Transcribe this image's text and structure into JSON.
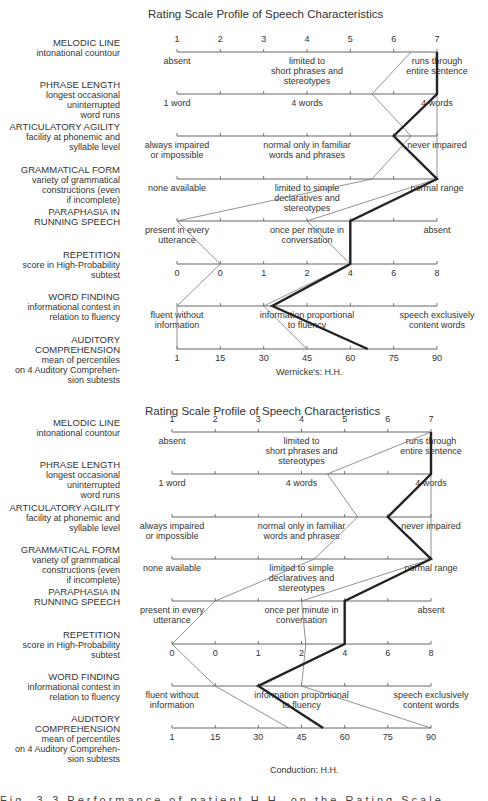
{
  "chart_data": [
    {
      "type": "line",
      "title": "Rating Scale Profile of Speech Characteristics",
      "caption": "Wernicke's: H.H.",
      "scale": "1-7 rating per row (left = impaired, right = normal)",
      "rows": [
        {
          "name": "MELODIC LINE",
          "sub": [
            "intonational countour"
          ],
          "ticks": [
            "1",
            "2",
            "3",
            "4",
            "5",
            "6",
            "7"
          ],
          "descriptors": [
            {
              "pos": 1,
              "text": [
                "absent"
              ]
            },
            {
              "pos": 4,
              "text": [
                "limited to",
                "short phrases and",
                "stereotypes"
              ]
            },
            {
              "pos": 7,
              "text": [
                "runs through",
                "entire sentence"
              ]
            }
          ]
        },
        {
          "name": "PHRASE LENGTH",
          "sub": [
            "longest occasional",
            "uninterrupted",
            "word runs"
          ],
          "ticks": [],
          "descriptors": [
            {
              "pos": 1,
              "text": [
                "1 word"
              ]
            },
            {
              "pos": 4,
              "text": [
                "4 words"
              ]
            },
            {
              "pos": 7,
              "text": [
                "4 words"
              ]
            }
          ]
        },
        {
          "name": "ARTICULATORY AGILITY",
          "sub": [
            "facility at phonemic and",
            "syllable level"
          ],
          "ticks": [],
          "descriptors": [
            {
              "pos": 1,
              "text": [
                "always impaired",
                "or impossible"
              ]
            },
            {
              "pos": 4,
              "text": [
                "normal only in familiar",
                "words and phrases"
              ]
            },
            {
              "pos": 7,
              "text": [
                "never impaired"
              ]
            }
          ]
        },
        {
          "name": "GRAMMATICAL FORM",
          "sub": [
            "variety of grammatical",
            "constructions (even",
            "if incomplete)"
          ],
          "ticks": [],
          "descriptors": [
            {
              "pos": 1,
              "text": [
                "none available"
              ]
            },
            {
              "pos": 4,
              "text": [
                "limited to simple",
                "declaratives and",
                "stereotypes"
              ]
            },
            {
              "pos": 7,
              "text": [
                "normal range"
              ]
            }
          ]
        },
        {
          "name": "PARAPHASIA IN",
          "name2": "RUNNING SPEECH",
          "sub": [],
          "ticks": [],
          "descriptors": [
            {
              "pos": 1,
              "text": [
                "present in every",
                "utterance"
              ]
            },
            {
              "pos": 4,
              "text": [
                "once per minute in",
                "conversation"
              ]
            },
            {
              "pos": 7,
              "text": [
                "absent"
              ]
            }
          ]
        },
        {
          "name": "REPETITION",
          "sub": [
            "score in High-Probability",
            "subtest"
          ],
          "ticks": [
            "0",
            "0",
            "1",
            "2",
            "4",
            "6",
            "8"
          ],
          "descriptors": []
        },
        {
          "name": "WORD FINDING",
          "sub": [
            "informational contest in",
            "relation to fluency"
          ],
          "ticks": [],
          "descriptors": [
            {
              "pos": 1,
              "text": [
                "fluent without",
                "information"
              ]
            },
            {
              "pos": 4,
              "text": [
                "information proportional",
                "to fluency"
              ]
            },
            {
              "pos": 7,
              "text": [
                "speech exclusively",
                "content words"
              ]
            }
          ]
        },
        {
          "name": "AUDITORY",
          "name2": "COMPREHENSION",
          "sub": [
            "mean of percentiles",
            "on 4 Auditory Comprehen-",
            "sion subtests"
          ],
          "ticks": [
            "1",
            "15",
            "30",
            "45",
            "60",
            "75",
            "90"
          ],
          "descriptors": []
        }
      ],
      "series": [
        {
          "name": "profile-bold",
          "style": "thick",
          "values": [
            7,
            7,
            6,
            7,
            5,
            5,
            3.2,
            5.4
          ]
        },
        {
          "name": "profile-thin-a",
          "style": "thin",
          "values": [
            6.4,
            5.5,
            6.4,
            5.5,
            1,
            2,
            1,
            1
          ]
        },
        {
          "name": "profile-thin-b",
          "style": "thin",
          "values": [
            7,
            7,
            7,
            7,
            4,
            5,
            3,
            4
          ]
        }
      ],
      "xlim": [
        1,
        7
      ]
    },
    {
      "type": "line",
      "title": "Rating Scale Profile of Speech Characteristics",
      "caption": "Conduction: H.H.",
      "scale": "1-7 rating per row (left = impaired, right = normal)",
      "rows": [
        {
          "name": "MELODIC LINE",
          "sub": [
            "intonational countour"
          ],
          "ticks": [
            "1",
            "2",
            "3",
            "4",
            "5",
            "6",
            "7"
          ],
          "descriptors": [
            {
              "pos": 1,
              "text": [
                "absent"
              ]
            },
            {
              "pos": 4,
              "text": [
                "limited to",
                "short phrases and",
                "stereotypes"
              ]
            },
            {
              "pos": 7,
              "text": [
                "runs through",
                "entire sentence"
              ]
            }
          ]
        },
        {
          "name": "PHRASE LENGTH",
          "sub": [
            "longest occasional",
            "uninterrupted",
            "word runs"
          ],
          "ticks": [],
          "descriptors": [
            {
              "pos": 1,
              "text": [
                "1 word"
              ]
            },
            {
              "pos": 4,
              "text": [
                "4 words"
              ]
            },
            {
              "pos": 7,
              "text": [
                "4 words"
              ]
            }
          ]
        },
        {
          "name": "ARTICULATORY AGILITY",
          "sub": [
            "facility at phonemic and",
            "syllable level"
          ],
          "ticks": [],
          "descriptors": [
            {
              "pos": 1,
              "text": [
                "always impaired",
                "or impossible"
              ]
            },
            {
              "pos": 4,
              "text": [
                "normal only in familiar",
                "words and phrases"
              ]
            },
            {
              "pos": 7,
              "text": [
                "never impaired"
              ]
            }
          ]
        },
        {
          "name": "GRAMMATICAL FORM",
          "sub": [
            "variety of grammatical",
            "constructions (even",
            "if incomplete)"
          ],
          "ticks": [],
          "descriptors": [
            {
              "pos": 1,
              "text": [
                "none available"
              ]
            },
            {
              "pos": 4,
              "text": [
                "limited to simple",
                "declaratives and",
                "stereotypes"
              ]
            },
            {
              "pos": 7,
              "text": [
                "normal range"
              ]
            }
          ]
        },
        {
          "name": "PARAPHASIA IN",
          "name2": "RUNNING SPEECH",
          "sub": [],
          "ticks": [],
          "descriptors": [
            {
              "pos": 1,
              "text": [
                "present in every",
                "utterance"
              ]
            },
            {
              "pos": 4,
              "text": [
                "once per minute in",
                "conversation"
              ]
            },
            {
              "pos": 7,
              "text": [
                "absent"
              ]
            }
          ]
        },
        {
          "name": "REPETITION",
          "sub": [
            "score in High-Probability",
            "subtest"
          ],
          "ticks": [
            "0",
            "0",
            "1",
            "2",
            "4",
            "6",
            "8"
          ],
          "descriptors": []
        },
        {
          "name": "WORD FINDING",
          "sub": [
            "informational contest in",
            "relation to fluency"
          ],
          "ticks": [],
          "descriptors": [
            {
              "pos": 1,
              "text": [
                "fluent without",
                "information"
              ]
            },
            {
              "pos": 4,
              "text": [
                "information proportional",
                "to fluency"
              ]
            },
            {
              "pos": 7,
              "text": [
                "speech exclusively",
                "content words"
              ]
            }
          ]
        },
        {
          "name": "AUDITORY",
          "name2": "COMPREHENSION",
          "sub": [
            "mean of percentiles",
            "on 4 Auditory Comprehen-",
            "sion subtests"
          ],
          "ticks": [
            "1",
            "15",
            "30",
            "45",
            "60",
            "75",
            "90"
          ],
          "descriptors": []
        }
      ],
      "series": [
        {
          "name": "profile-bold",
          "style": "thick",
          "values": [
            7,
            7,
            6,
            7,
            5,
            5,
            3,
            4.5
          ]
        },
        {
          "name": "profile-thin-a",
          "style": "thin",
          "values": [
            7,
            4.6,
            5.3,
            4.3,
            2,
            1,
            2,
            3.7
          ]
        },
        {
          "name": "profile-thin-b",
          "style": "thin",
          "values": [
            7,
            7,
            7,
            7,
            4,
            4.1,
            4,
            7
          ]
        }
      ],
      "xlim": [
        1,
        7
      ]
    }
  ],
  "bottom_caption_partial": "Fig. 3-3   Performance of patient H.H. on the Rating Scale Profile ..."
}
